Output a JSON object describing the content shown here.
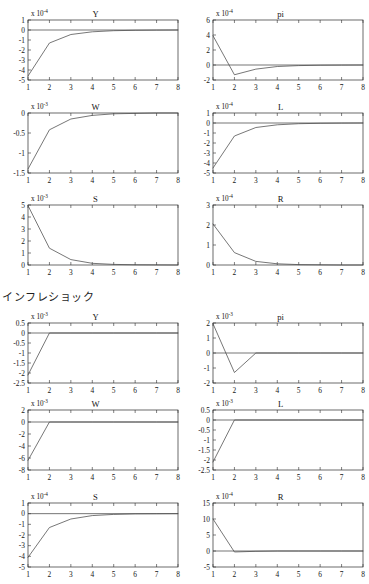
{
  "figure": {
    "section_label": "インフレショック",
    "x_axis_ticks": [
      "1",
      "2",
      "3",
      "4",
      "5",
      "6",
      "7",
      "8"
    ],
    "multiplier_prefix": "x 10",
    "panel_count": 12
  },
  "chart_data": [
    {
      "type": "line",
      "title": "Y",
      "exponent": "-4",
      "multiplier_label": "x 10-4",
      "xlabel": "",
      "ylabel": "",
      "x": [
        1,
        2,
        3,
        4,
        5,
        6,
        7,
        8
      ],
      "values": [
        -4.6,
        -1.3,
        -0.45,
        -0.18,
        -0.07,
        -0.03,
        -0.01,
        0.0
      ],
      "xlim": [
        1,
        8
      ],
      "ylim": [
        -5,
        1
      ],
      "yticks": [
        "1",
        "0",
        "-1",
        "-2",
        "-3",
        "-4",
        "-5"
      ],
      "ytick_values": [
        1,
        0,
        -1,
        -2,
        -3,
        -4,
        -5
      ],
      "xticks": [
        "1",
        "2",
        "3",
        "4",
        "5",
        "6",
        "7",
        "8"
      ],
      "grid": false,
      "zero_line": true
    },
    {
      "type": "line",
      "title": "pi",
      "exponent": "-4",
      "multiplier_label": "x 10-4",
      "xlabel": "",
      "ylabel": "",
      "x": [
        1,
        2,
        3,
        4,
        5,
        6,
        7,
        8
      ],
      "values": [
        3.9,
        -1.3,
        -0.55,
        -0.2,
        -0.08,
        -0.03,
        -0.01,
        0.0
      ],
      "xlim": [
        1,
        8
      ],
      "ylim": [
        -2,
        6
      ],
      "yticks": [
        "6",
        "4",
        "2",
        "0",
        "-2"
      ],
      "ytick_values": [
        6,
        4,
        2,
        0,
        -2
      ],
      "xticks": [
        "1",
        "2",
        "3",
        "4",
        "5",
        "6",
        "7",
        "8"
      ],
      "grid": false,
      "zero_line": true
    },
    {
      "type": "line",
      "title": "W",
      "exponent": "-3",
      "multiplier_label": "x 10-3",
      "xlabel": "",
      "ylabel": "",
      "x": [
        1,
        2,
        3,
        4,
        5,
        6,
        7,
        8
      ],
      "values": [
        -1.4,
        -0.42,
        -0.15,
        -0.06,
        -0.02,
        -0.01,
        0.0,
        0.0
      ],
      "xlim": [
        1,
        8
      ],
      "ylim": [
        -1.5,
        0
      ],
      "yticks": [
        "0",
        "-0.5",
        "-1",
        "-1.5"
      ],
      "ytick_values": [
        0,
        -0.5,
        -1,
        -1.5
      ],
      "xticks": [
        "1",
        "2",
        "3",
        "4",
        "5",
        "6",
        "7",
        "8"
      ],
      "grid": false,
      "zero_line": false
    },
    {
      "type": "line",
      "title": "L",
      "exponent": "-4",
      "multiplier_label": "x 10-4",
      "xlabel": "",
      "ylabel": "",
      "x": [
        1,
        2,
        3,
        4,
        5,
        6,
        7,
        8
      ],
      "values": [
        -4.5,
        -1.3,
        -0.45,
        -0.18,
        -0.07,
        -0.03,
        -0.01,
        0.0
      ],
      "xlim": [
        1,
        8
      ],
      "ylim": [
        -5,
        1
      ],
      "yticks": [
        "1",
        "0",
        "-1",
        "-2",
        "-3",
        "-4",
        "-5"
      ],
      "ytick_values": [
        1,
        0,
        -1,
        -2,
        -3,
        -4,
        -5
      ],
      "xticks": [
        "1",
        "2",
        "3",
        "4",
        "5",
        "6",
        "7",
        "8"
      ],
      "grid": false,
      "zero_line": true
    },
    {
      "type": "line",
      "title": "S",
      "exponent": "-3",
      "multiplier_label": "x 10-3",
      "xlabel": "",
      "ylabel": "",
      "x": [
        1,
        2,
        3,
        4,
        5,
        6,
        7,
        8
      ],
      "values": [
        4.95,
        1.4,
        0.45,
        0.14,
        0.05,
        0.02,
        0.01,
        0.0
      ],
      "xlim": [
        1,
        8
      ],
      "ylim": [
        0,
        5
      ],
      "yticks": [
        "5",
        "4",
        "3",
        "2",
        "1",
        "0"
      ],
      "ytick_values": [
        5,
        4,
        3,
        2,
        1,
        0
      ],
      "xticks": [
        "1",
        "2",
        "3",
        "4",
        "5",
        "6",
        "7",
        "8"
      ],
      "grid": false,
      "zero_line": false
    },
    {
      "type": "line",
      "title": "R",
      "exponent": "-4",
      "multiplier_label": "x 10-4",
      "xlabel": "",
      "ylabel": "",
      "x": [
        1,
        2,
        3,
        4,
        5,
        6,
        7,
        8
      ],
      "values": [
        2.05,
        0.62,
        0.18,
        0.06,
        0.02,
        0.01,
        0.0,
        0.0
      ],
      "xlim": [
        1,
        8
      ],
      "ylim": [
        0,
        3
      ],
      "yticks": [
        "3",
        "2",
        "1",
        "0"
      ],
      "ytick_values": [
        3,
        2,
        1,
        0
      ],
      "xticks": [
        "1",
        "2",
        "3",
        "4",
        "5",
        "6",
        "7",
        "8"
      ],
      "grid": false,
      "zero_line": false
    },
    {
      "type": "line",
      "title": "Y",
      "exponent": "-3",
      "multiplier_label": "x 10-3",
      "xlabel": "",
      "ylabel": "",
      "x": [
        1,
        2,
        3,
        4,
        5,
        6,
        7,
        8
      ],
      "values": [
        -2.1,
        0.0,
        0.0,
        0.0,
        0.0,
        0.0,
        0.0,
        0.0
      ],
      "xlim": [
        1,
        8
      ],
      "ylim": [
        -2.5,
        0.5
      ],
      "yticks": [
        "0.5",
        "0",
        "-0.5",
        "-1",
        "-1.5",
        "-2",
        "-2.5"
      ],
      "ytick_values": [
        0.5,
        0,
        -0.5,
        -1,
        -1.5,
        -2,
        -2.5
      ],
      "xticks": [
        "1",
        "2",
        "3",
        "4",
        "5",
        "6",
        "7",
        "8"
      ],
      "grid": false,
      "zero_line": true
    },
    {
      "type": "line",
      "title": "pi",
      "exponent": "-3",
      "multiplier_label": "x 10-3",
      "xlabel": "",
      "ylabel": "",
      "x": [
        1,
        2,
        3,
        4,
        5,
        6,
        7,
        8
      ],
      "values": [
        1.95,
        -1.3,
        0.0,
        0.0,
        0.0,
        0.0,
        0.0,
        0.0
      ],
      "xlim": [
        1,
        8
      ],
      "ylim": [
        -2,
        2
      ],
      "yticks": [
        "2",
        "1",
        "0",
        "-1",
        "-2"
      ],
      "ytick_values": [
        2,
        1,
        0,
        -1,
        -2
      ],
      "xticks": [
        "1",
        "2",
        "3",
        "4",
        "5",
        "6",
        "7",
        "8"
      ],
      "grid": false,
      "zero_line": true
    },
    {
      "type": "line",
      "title": "W",
      "exponent": "-3",
      "multiplier_label": "x 10-3",
      "xlabel": "",
      "ylabel": "",
      "x": [
        1,
        2,
        3,
        4,
        5,
        6,
        7,
        8
      ],
      "values": [
        -6.4,
        0.0,
        0.0,
        0.0,
        0.0,
        0.0,
        0.0,
        0.0
      ],
      "xlim": [
        1,
        8
      ],
      "ylim": [
        -8,
        2
      ],
      "yticks": [
        "2",
        "0",
        "-2",
        "-4",
        "-6",
        "-8"
      ],
      "ytick_values": [
        2,
        0,
        -2,
        -4,
        -6,
        -8
      ],
      "xticks": [
        "1",
        "2",
        "3",
        "4",
        "5",
        "6",
        "7",
        "8"
      ],
      "grid": false,
      "zero_line": true
    },
    {
      "type": "line",
      "title": "L",
      "exponent": "-3",
      "multiplier_label": "x 10-3",
      "xlabel": "",
      "ylabel": "",
      "x": [
        1,
        2,
        3,
        4,
        5,
        6,
        7,
        8
      ],
      "values": [
        -2.1,
        0.0,
        0.0,
        0.0,
        0.0,
        0.0,
        0.0,
        0.0
      ],
      "xlim": [
        1,
        8
      ],
      "ylim": [
        -2.5,
        0.5
      ],
      "yticks": [
        "0.5",
        "0",
        "-0.5",
        "-1",
        "-1.5",
        "-2",
        "-2.5"
      ],
      "ytick_values": [
        0.5,
        0,
        -0.5,
        -1,
        -1.5,
        -2,
        -2.5
      ],
      "xticks": [
        "1",
        "2",
        "3",
        "4",
        "5",
        "6",
        "7",
        "8"
      ],
      "grid": false,
      "zero_line": true
    },
    {
      "type": "line",
      "title": "S",
      "exponent": "-4",
      "multiplier_label": "x 10-4",
      "xlabel": "",
      "ylabel": "",
      "x": [
        1,
        2,
        3,
        4,
        5,
        6,
        7,
        8
      ],
      "values": [
        -4.1,
        -1.3,
        -0.5,
        -0.18,
        -0.07,
        -0.02,
        -0.01,
        0.0
      ],
      "xlim": [
        1,
        8
      ],
      "ylim": [
        -5,
        1
      ],
      "yticks": [
        "1",
        "0",
        "-1",
        "-2",
        "-3",
        "-4",
        "-5"
      ],
      "ytick_values": [
        1,
        0,
        -1,
        -2,
        -3,
        -4,
        -5
      ],
      "xticks": [
        "1",
        "2",
        "3",
        "4",
        "5",
        "6",
        "7",
        "8"
      ],
      "grid": false,
      "zero_line": true
    },
    {
      "type": "line",
      "title": "R",
      "exponent": "-4",
      "multiplier_label": "x 10-4",
      "xlabel": "",
      "ylabel": "",
      "x": [
        1,
        2,
        3,
        4,
        5,
        6,
        7,
        8
      ],
      "values": [
        10.0,
        -0.3,
        -0.1,
        0.0,
        0.0,
        0.0,
        0.0,
        0.0
      ],
      "xlim": [
        1,
        8
      ],
      "ylim": [
        -5,
        15
      ],
      "yticks": [
        "15",
        "10",
        "5",
        "0",
        "-5"
      ],
      "ytick_values": [
        15,
        10,
        5,
        0,
        -5
      ],
      "xticks": [
        "1",
        "2",
        "3",
        "4",
        "5",
        "6",
        "7",
        "8"
      ],
      "grid": false,
      "zero_line": true
    }
  ],
  "panel_layout": [
    {
      "left": 0,
      "top": 6,
      "w": 184,
      "h": 88
    },
    {
      "left": 185,
      "top": 6,
      "w": 184,
      "h": 88
    },
    {
      "left": 0,
      "top": 99,
      "w": 184,
      "h": 88
    },
    {
      "left": 185,
      "top": 99,
      "w": 184,
      "h": 88
    },
    {
      "left": 0,
      "top": 191,
      "w": 184,
      "h": 88
    },
    {
      "left": 185,
      "top": 191,
      "w": 184,
      "h": 88
    },
    {
      "left": 0,
      "top": 309,
      "w": 184,
      "h": 88
    },
    {
      "left": 185,
      "top": 309,
      "w": 184,
      "h": 88
    },
    {
      "left": 0,
      "top": 396,
      "w": 184,
      "h": 88
    },
    {
      "left": 185,
      "top": 396,
      "w": 184,
      "h": 88
    },
    {
      "left": 0,
      "top": 489,
      "w": 184,
      "h": 92
    },
    {
      "left": 185,
      "top": 489,
      "w": 184,
      "h": 92
    }
  ]
}
